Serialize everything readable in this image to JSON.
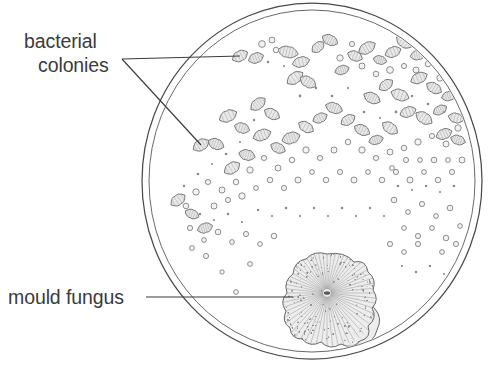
{
  "figure": {
    "background_color": "#ffffff",
    "line_color": "#4a4a4a",
    "text_color": "#3b3b3b",
    "colony_fill_color": "#e9e9e9",
    "mould_fill_color": "#ededed"
  },
  "labels": {
    "bacterial_line1": "bacterial",
    "bacterial_line2": "colonies",
    "mould": "mould fungus"
  },
  "dish": {
    "name": "petri-dish",
    "center_x": 312,
    "center_y": 181,
    "outer_radius_x": 170,
    "outer_radius_y": 178,
    "inner_radius_x": 163,
    "inner_radius_y": 171
  },
  "leaders": {
    "bacterial_junction_x": 122,
    "bacterial_junction_y": 59,
    "bacterial_target_1_x": 240,
    "bacterial_target_1_y": 56,
    "bacterial_target_2_x": 201,
    "bacterial_target_2_y": 145,
    "mould_start_x": 146,
    "mould_start_y": 297,
    "mould_target_x": 293,
    "mould_target_y": 297
  },
  "mould_fungus": {
    "name": "mould-fungus-colony",
    "center_x": 327,
    "center_y": 293,
    "radius": 39,
    "lobe_center_x": 354,
    "lobe_center_y": 318,
    "lobe_radius": 22,
    "ray_count": 60
  },
  "chart_data": {
    "type": "scatter",
    "xlabel": "",
    "ylabel": "",
    "legend": [
      "bacterial colonies",
      "mould fungus"
    ],
    "colony_blobs": [
      [
        240,
        56,
        8.5,
        5.2,
        -28
      ],
      [
        256,
        58,
        8.0,
        5.0,
        -20
      ],
      [
        288,
        52,
        10.5,
        5.6,
        12
      ],
      [
        301,
        62,
        9.0,
        5.0,
        -15
      ],
      [
        318,
        47,
        7.5,
        4.6,
        -40
      ],
      [
        330,
        40,
        8.5,
        5.0,
        25
      ],
      [
        295,
        78,
        9.5,
        5.4,
        -35
      ],
      [
        308,
        82,
        9.0,
        5.2,
        30
      ],
      [
        342,
        70,
        7.5,
        4.4,
        -18
      ],
      [
        355,
        56,
        8.0,
        4.8,
        22
      ],
      [
        367,
        48,
        9.5,
        5.4,
        -30
      ],
      [
        380,
        60,
        7.0,
        4.2,
        15
      ],
      [
        393,
        52,
        8.5,
        5.0,
        -22
      ],
      [
        404,
        42,
        9.0,
        5.2,
        35
      ],
      [
        418,
        55,
        8.0,
        4.8,
        -12
      ],
      [
        432,
        47,
        9.5,
        5.4,
        28
      ],
      [
        443,
        62,
        8.5,
        5.0,
        -32
      ],
      [
        455,
        73,
        7.5,
        4.6,
        18
      ],
      [
        419,
        78,
        9.0,
        5.2,
        -25
      ],
      [
        434,
        88,
        8.5,
        5.0,
        30
      ],
      [
        449,
        96,
        7.8,
        4.6,
        -15
      ],
      [
        400,
        95,
        9.5,
        5.5,
        20
      ],
      [
        386,
        85,
        8.0,
        4.8,
        -35
      ],
      [
        372,
        98,
        9.0,
        5.2,
        25
      ],
      [
        408,
        112,
        8.5,
        5.0,
        -20
      ],
      [
        424,
        118,
        9.5,
        5.4,
        32
      ],
      [
        440,
        110,
        7.5,
        4.4,
        -28
      ],
      [
        456,
        118,
        8.0,
        4.8,
        15
      ],
      [
        201,
        145,
        9.0,
        5.4,
        -30
      ],
      [
        216,
        144,
        8.5,
        5.2,
        22
      ],
      [
        228,
        116,
        9.5,
        5.6,
        -25
      ],
      [
        242,
        128,
        8.0,
        5.0,
        18
      ],
      [
        258,
        104,
        9.0,
        5.2,
        -38
      ],
      [
        272,
        114,
        8.5,
        5.0,
        28
      ],
      [
        262,
        135,
        9.5,
        5.4,
        -20
      ],
      [
        247,
        155,
        8.5,
        5.2,
        15
      ],
      [
        232,
        168,
        9.0,
        5.4,
        -32
      ],
      [
        278,
        148,
        8.0,
        4.8,
        25
      ],
      [
        291,
        138,
        9.5,
        5.6,
        -18
      ],
      [
        306,
        127,
        8.5,
        5.0,
        30
      ],
      [
        320,
        118,
        7.8,
        4.6,
        -24
      ],
      [
        334,
        108,
        9.0,
        5.2,
        20
      ],
      [
        348,
        120,
        8.0,
        4.8,
        -30
      ],
      [
        362,
        130,
        8.5,
        5.0,
        26
      ],
      [
        376,
        140,
        7.5,
        4.4,
        -16
      ],
      [
        390,
        128,
        9.0,
        5.2,
        34
      ],
      [
        444,
        134,
        8.5,
        5.0,
        -22
      ],
      [
        458,
        140,
        7.8,
        4.6,
        18
      ],
      [
        178,
        200,
        8.5,
        5.2,
        -35
      ],
      [
        192,
        214,
        7.5,
        4.4,
        22
      ],
      [
        205,
        228,
        8.0,
        4.8,
        -18
      ]
    ],
    "colony_dots": [
      [
        262,
        44,
        3.4
      ],
      [
        272,
        40,
        3.0
      ],
      [
        276,
        50,
        2.8
      ],
      [
        340,
        58,
        3.2
      ],
      [
        352,
        44,
        2.6
      ],
      [
        362,
        66,
        3.0
      ],
      [
        376,
        74,
        2.8
      ],
      [
        390,
        70,
        3.4
      ],
      [
        404,
        66,
        2.6
      ],
      [
        416,
        70,
        3.0
      ],
      [
        428,
        64,
        2.8
      ],
      [
        440,
        78,
        3.2
      ],
      [
        452,
        86,
        2.6
      ],
      [
        464,
        96,
        3.0
      ],
      [
        466,
        110,
        2.8
      ],
      [
        458,
        128,
        3.2
      ],
      [
        468,
        124,
        2.4
      ],
      [
        446,
        144,
        3.0
      ],
      [
        432,
        136,
        2.6
      ],
      [
        418,
        142,
        3.2
      ],
      [
        404,
        148,
        2.8
      ],
      [
        390,
        152,
        3.0
      ],
      [
        376,
        158,
        2.6
      ],
      [
        362,
        150,
        3.2
      ],
      [
        348,
        142,
        2.8
      ],
      [
        334,
        150,
        3.0
      ],
      [
        320,
        158,
        2.6
      ],
      [
        306,
        150,
        3.2
      ],
      [
        292,
        160,
        2.8
      ],
      [
        278,
        168,
        3.0
      ],
      [
        264,
        158,
        2.6
      ],
      [
        250,
        170,
        3.2
      ],
      [
        236,
        182,
        2.8
      ],
      [
        222,
        190,
        3.0
      ],
      [
        208,
        182,
        2.6
      ],
      [
        196,
        192,
        3.2
      ],
      [
        186,
        206,
        2.8
      ],
      [
        214,
        206,
        3.0
      ],
      [
        228,
        200,
        2.6
      ],
      [
        242,
        196,
        3.2
      ],
      [
        256,
        188,
        2.4
      ],
      [
        270,
        180,
        2.8
      ],
      [
        284,
        188,
        2.6
      ],
      [
        298,
        180,
        3.0
      ],
      [
        312,
        172,
        2.4
      ],
      [
        326,
        180,
        2.8
      ],
      [
        340,
        172,
        2.6
      ],
      [
        354,
        180,
        3.0
      ],
      [
        368,
        172,
        2.4
      ],
      [
        382,
        180,
        2.8
      ],
      [
        396,
        172,
        2.6
      ],
      [
        410,
        180,
        3.0
      ],
      [
        424,
        172,
        2.4
      ],
      [
        438,
        180,
        2.8
      ],
      [
        452,
        172,
        2.6
      ],
      [
        462,
        160,
        3.0
      ],
      [
        448,
        160,
        2.4
      ],
      [
        434,
        160,
        2.8
      ],
      [
        420,
        160,
        2.4
      ],
      [
        406,
        160,
        2.6
      ],
      [
        392,
        168,
        2.4
      ],
      [
        190,
        228,
        2.6
      ],
      [
        204,
        240,
        2.4
      ],
      [
        218,
        232,
        2.8
      ],
      [
        232,
        242,
        2.4
      ],
      [
        246,
        234,
        2.6
      ],
      [
        260,
        244,
        2.4
      ],
      [
        274,
        236,
        2.8
      ],
      [
        192,
        248,
        2.4
      ],
      [
        206,
        256,
        2.6
      ],
      [
        394,
        200,
        2.8
      ],
      [
        408,
        212,
        2.4
      ],
      [
        422,
        204,
        2.6
      ],
      [
        436,
        216,
        2.4
      ],
      [
        450,
        208,
        2.8
      ],
      [
        404,
        228,
        2.4
      ],
      [
        418,
        236,
        2.6
      ],
      [
        432,
        228,
        2.4
      ],
      [
        446,
        238,
        2.8
      ],
      [
        460,
        226,
        2.4
      ],
      [
        390,
        244,
        2.6
      ],
      [
        404,
        252,
        2.4
      ],
      [
        418,
        244,
        2.6
      ],
      [
        442,
        252,
        2.4
      ],
      [
        456,
        244,
        2.6
      ],
      [
        236,
        292,
        2.4
      ],
      [
        222,
        272,
        2.2
      ],
      [
        250,
        264,
        2.4
      ]
    ],
    "colony_specks": [
      [
        268,
        62,
        1.3
      ],
      [
        284,
        66,
        1.1
      ],
      [
        300,
        96,
        1.4
      ],
      [
        316,
        88,
        1.2
      ],
      [
        332,
        96,
        1.3
      ],
      [
        348,
        88,
        1.1
      ],
      [
        364,
        112,
        1.3
      ],
      [
        380,
        118,
        1.1
      ],
      [
        396,
        112,
        1.4
      ],
      [
        412,
        96,
        1.2
      ],
      [
        428,
        104,
        1.3
      ],
      [
        444,
        112,
        1.1
      ],
      [
        460,
        104,
        1.3
      ],
      [
        254,
        120,
        1.2
      ],
      [
        240,
        142,
        1.1
      ],
      [
        226,
        154,
        1.3
      ],
      [
        212,
        164,
        1.1
      ],
      [
        198,
        174,
        1.3
      ],
      [
        184,
        186,
        1.2
      ],
      [
        258,
        210,
        1.2
      ],
      [
        272,
        216,
        1.1
      ],
      [
        286,
        208,
        1.3
      ],
      [
        300,
        216,
        1.1
      ],
      [
        314,
        208,
        1.2
      ],
      [
        328,
        216,
        1.1
      ],
      [
        342,
        208,
        1.3
      ],
      [
        356,
        216,
        1.1
      ],
      [
        370,
        208,
        1.2
      ],
      [
        384,
        216,
        1.1
      ],
      [
        398,
        186,
        1.3
      ],
      [
        412,
        190,
        1.1
      ],
      [
        426,
        186,
        1.2
      ],
      [
        440,
        192,
        1.1
      ],
      [
        454,
        186,
        1.3
      ],
      [
        200,
        214,
        1.2
      ],
      [
        214,
        220,
        1.1
      ],
      [
        228,
        214,
        1.3
      ],
      [
        242,
        222,
        1.1
      ],
      [
        430,
        266,
        1.2
      ],
      [
        444,
        274,
        1.1
      ],
      [
        416,
        272,
        1.3
      ],
      [
        402,
        266,
        1.1
      ],
      [
        458,
        266,
        1.2
      ]
    ]
  }
}
